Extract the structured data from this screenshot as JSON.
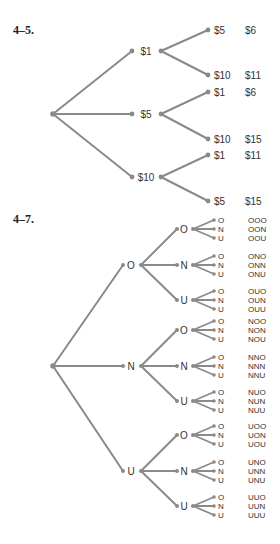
{
  "problems": [
    {
      "label": "4–5.",
      "tree": {
        "branches": [
          {
            "label": "$1",
            "children": [
              {
                "label": "$5",
                "total": "$6"
              },
              {
                "label": "$10",
                "total": "$11"
              }
            ]
          },
          {
            "label": "$5",
            "children": [
              {
                "label": "$1",
                "total": "$6"
              },
              {
                "label": "$10",
                "total": "$15"
              }
            ]
          },
          {
            "label": "$10",
            "children": [
              {
                "label": "$1",
                "total": "$11"
              },
              {
                "label": "$5",
                "total": "$15"
              }
            ]
          }
        ]
      }
    },
    {
      "label": "4–7.",
      "tree": {
        "branches": [
          {
            "label": "O",
            "children": [
              {
                "label": "O",
                "leaves": [
                  {
                    "label": "O",
                    "outcome": "OOO"
                  },
                  {
                    "label": "N",
                    "outcome": "OON"
                  },
                  {
                    "label": "U",
                    "outcome": "OOU"
                  }
                ]
              },
              {
                "label": "N",
                "leaves": [
                  {
                    "label": "O",
                    "outcome": "ONO"
                  },
                  {
                    "label": "N",
                    "outcome": "ONN"
                  },
                  {
                    "label": "U",
                    "outcome": "ONU"
                  }
                ]
              },
              {
                "label": "U",
                "leaves": [
                  {
                    "label": "O",
                    "outcome": "OUO"
                  },
                  {
                    "label": "N",
                    "outcome": "OUN"
                  },
                  {
                    "label": "U",
                    "outcome": "OUU"
                  }
                ]
              }
            ]
          },
          {
            "label": "N",
            "children": [
              {
                "label": "O",
                "leaves": [
                  {
                    "label": "O",
                    "outcome": "NOO"
                  },
                  {
                    "label": "N",
                    "outcome": "NON"
                  },
                  {
                    "label": "U",
                    "outcome": "NOU"
                  }
                ]
              },
              {
                "label": "N",
                "leaves": [
                  {
                    "label": "O",
                    "outcome": "NNO"
                  },
                  {
                    "label": "N",
                    "outcome": "NNN"
                  },
                  {
                    "label": "U",
                    "outcome": "NNU"
                  }
                ]
              },
              {
                "label": "U",
                "leaves": [
                  {
                    "label": "O",
                    "outcome": "NUO"
                  },
                  {
                    "label": "N",
                    "outcome": "NUN"
                  },
                  {
                    "label": "U",
                    "outcome": "NUU"
                  }
                ]
              }
            ]
          },
          {
            "label": "U",
            "children": [
              {
                "label": "O",
                "leaves": [
                  {
                    "label": "O",
                    "outcome": "UOO"
                  },
                  {
                    "label": "N",
                    "outcome": "UON"
                  },
                  {
                    "label": "U",
                    "outcome": "UOU"
                  }
                ]
              },
              {
                "label": "N",
                "leaves": [
                  {
                    "label": "O",
                    "outcome": "UNO"
                  },
                  {
                    "label": "N",
                    "outcome": "UNN"
                  },
                  {
                    "label": "U",
                    "outcome": "UNU"
                  }
                ]
              },
              {
                "label": "U",
                "leaves": [
                  {
                    "label": "O",
                    "outcome": "UUO"
                  },
                  {
                    "label": "N",
                    "outcome": "UUN"
                  },
                  {
                    "label": "U",
                    "outcome": "UUU"
                  }
                ]
              }
            ]
          }
        ]
      }
    }
  ],
  "colors": {
    "line": "#8a8a8a",
    "dot": "#8a8a8a",
    "text": "#333333"
  }
}
